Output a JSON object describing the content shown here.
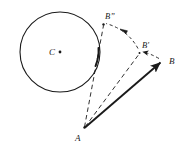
{
  "figure": {
    "background_color": "#ffffff",
    "stroke_color": "#1a1a1a",
    "width": 186,
    "height": 147
  },
  "circle": {
    "label": "C",
    "center_label": "C",
    "center_x": 60,
    "center_y": 52,
    "radius": 40,
    "stroke_color": "#1a1a1a",
    "stroke_width": 1.1,
    "fill": "none",
    "center_dot_radius": 1.3
  },
  "points": {
    "A": {
      "label": "A",
      "x": 84,
      "y": 128,
      "label_x": 76,
      "label_y": 140
    },
    "B": {
      "label": "B",
      "x": 163,
      "y": 61,
      "label_x": 170,
      "label_y": 64
    },
    "B_prime": {
      "label": "B'",
      "x": 139,
      "y": 53,
      "label_x": 143,
      "label_y": 48
    },
    "B_double_prime": {
      "label": "B”",
      "x": 103,
      "y": 24,
      "label_x": 106,
      "label_y": 19
    }
  },
  "segments": [
    {
      "name": "vector-A-to-B",
      "style": "solid",
      "stroke_width": 1.9,
      "arrow": "end",
      "from": "A",
      "to": "B"
    },
    {
      "name": "vector-A-to-B-prime",
      "style": "dashed",
      "stroke_width": 0.9,
      "arrow": "none",
      "from": "A",
      "to": "B_prime"
    },
    {
      "name": "vector-A-to-B-double-prime",
      "style": "dashed",
      "stroke_width": 0.9,
      "arrow": "none",
      "from": "A",
      "to": "B_double_prime"
    }
  ],
  "arcs": [
    {
      "name": "rotation-arc-B-to-B-prime",
      "style": "dashed",
      "arrow": "end",
      "from": "B",
      "to": "B_prime"
    },
    {
      "name": "rotation-arc-B-prime-to-B-double-prime",
      "style": "dashed",
      "arrow": "mid",
      "from": "B_prime",
      "to": "B_double_prime"
    }
  ],
  "tangency": {
    "name": "tangent-contact-point",
    "x": 97,
    "y": 60,
    "description": "line A-B” touches circle C"
  }
}
